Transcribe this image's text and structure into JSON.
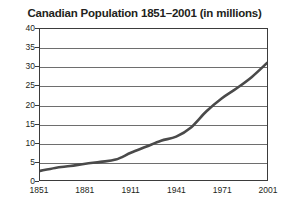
{
  "chart_data": {
    "type": "line",
    "title": "Canadian Population 1851–2001 (in millions)",
    "xlabel": "",
    "ylabel": "",
    "xlim": [
      1851,
      2001
    ],
    "ylim": [
      0,
      40
    ],
    "grid": true,
    "legend": false,
    "legend_position": "none",
    "line_color": "#4a4a4a",
    "grid_color": "#6e6e6e",
    "border_color": "#3b3b3b",
    "x_tick_labels": [
      "1851",
      "1881",
      "1911",
      "1941",
      "1971",
      "2001"
    ],
    "x_ticks": [
      1851,
      1881,
      1911,
      1941,
      1971,
      2001
    ],
    "y_tick_labels": [
      "0",
      "5",
      "10",
      "15",
      "20",
      "25",
      "30",
      "35",
      "40"
    ],
    "y_ticks": [
      0,
      5,
      10,
      15,
      20,
      25,
      30,
      35,
      40
    ],
    "series": [
      {
        "name": "Canadian Population",
        "x": [
          1851,
          1861,
          1871,
          1881,
          1891,
          1901,
          1911,
          1921,
          1931,
          1941,
          1951,
          1961,
          1971,
          1981,
          1991,
          2001
        ],
        "values": [
          2.4,
          3.2,
          3.7,
          4.3,
          4.8,
          5.4,
          7.2,
          8.8,
          10.4,
          11.5,
          14.0,
          18.2,
          21.6,
          24.3,
          27.3,
          31.0
        ]
      }
    ]
  }
}
